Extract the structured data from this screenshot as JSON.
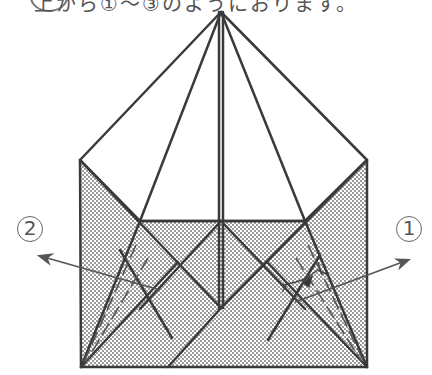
{
  "caption": {
    "text": "上から①〜③のようにおります。"
  },
  "labels": {
    "step_left": "2",
    "step_right": "1"
  },
  "colors": {
    "line": "#3a3a3a",
    "dots": "#6a6a6a",
    "paper": "#ffffff"
  }
}
